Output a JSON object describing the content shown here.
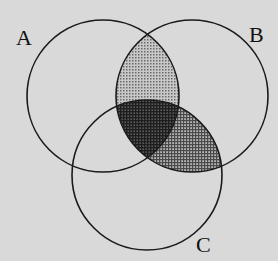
{
  "diagram": {
    "type": "venn",
    "background_color": "#d9d9d9",
    "stroke_color": "#1a1a1a",
    "sets": [
      {
        "id": "A",
        "label": "A",
        "cx": 103,
        "cy": 96,
        "r": 76,
        "label_x": 16,
        "label_y": 27
      },
      {
        "id": "B",
        "label": "B",
        "cx": 192,
        "cy": 96,
        "r": 76,
        "label_x": 249,
        "label_y": 24
      },
      {
        "id": "C",
        "label": "C",
        "cx": 147,
        "cy": 175,
        "r": 75,
        "label_x": 196,
        "label_y": 234
      }
    ],
    "shaded_regions": [
      {
        "region": "A ∩ B ∩ C'",
        "pattern": "light-dots",
        "color": "#9a9a9a"
      },
      {
        "region": "A ∩ B ∩ C",
        "pattern": "dense-crosshatch",
        "color": "#3a3a3a"
      },
      {
        "region": "A' ∩ B ∩ C",
        "pattern": "medium-crosshatch",
        "color": "#6a6a6a"
      }
    ]
  }
}
